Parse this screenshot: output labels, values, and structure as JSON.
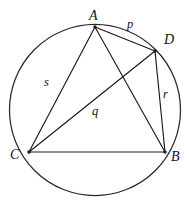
{
  "figure": {
    "kind": "cyclic-quadrilateral-with-diagonals",
    "caption": "",
    "background_color": "#ffffff",
    "line_color": "#1a1a1a",
    "circle": {
      "center_x": 95,
      "center_y": 110,
      "radius": 85.5
    },
    "vertices": [
      {
        "id": "A",
        "label": "A",
        "x": 95,
        "y": 27,
        "label_x": 89,
        "label_y": 9
      },
      {
        "id": "D",
        "label": "D",
        "x": 155,
        "y": 51,
        "label_x": 164,
        "label_y": 33
      },
      {
        "id": "B",
        "label": "B",
        "x": 165,
        "y": 152,
        "label_x": 171,
        "label_y": 150
      },
      {
        "id": "C",
        "label": "C",
        "x": 29,
        "y": 152,
        "label_x": 10,
        "label_y": 148
      }
    ],
    "segments": [
      {
        "id": "AD",
        "from": "A",
        "to": "D",
        "label": "p"
      },
      {
        "id": "DB",
        "from": "D",
        "to": "B",
        "label": "r"
      },
      {
        "id": "AC",
        "from": "A",
        "to": "C",
        "label": "s"
      },
      {
        "id": "CD",
        "from": "C",
        "to": "D",
        "label": "q"
      },
      {
        "id": "CB",
        "from": "C",
        "to": "B",
        "label": ""
      },
      {
        "id": "AB",
        "from": "A",
        "to": "B",
        "label": ""
      }
    ],
    "segment_labels": [
      {
        "id": "p",
        "text": "p",
        "x": 127,
        "y": 18
      },
      {
        "id": "s",
        "text": "s",
        "x": 44,
        "y": 76
      },
      {
        "id": "q",
        "text": "q",
        "x": 92,
        "y": 105
      },
      {
        "id": "r",
        "text": "r",
        "x": 163,
        "y": 88
      }
    ]
  }
}
